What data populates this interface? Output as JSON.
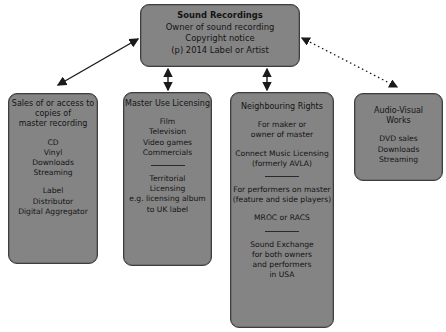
{
  "diagram": {
    "root": {
      "title": "Sound Recordings",
      "lines": [
        "Owner of sound recording",
        "Copyright notice",
        "(p) 2014 Label or Artist"
      ]
    },
    "nodes": [
      {
        "id": "sales",
        "title_lines": [
          "Sales of or access to",
          "copies of",
          "master recording"
        ],
        "group1": [
          "CD",
          "Vinyl",
          "Downloads",
          "Streaming"
        ],
        "group2": [
          "Label",
          "Distributor",
          "Digital Aggregator"
        ]
      },
      {
        "id": "master",
        "title": "Master Use Licensing",
        "group1": [
          "Film",
          "Television",
          "Video games",
          "Commercials"
        ],
        "group2": [
          "Territorial",
          "Licensing",
          "e.g. licensing album",
          "to UK label"
        ]
      },
      {
        "id": "neighbouring",
        "title": "Neighbouring Rights",
        "group1": [
          "For maker or",
          "owner of master"
        ],
        "group1b": [
          "Connect Music Licensing",
          "(formerly AVLA)"
        ],
        "group2": [
          "For performers on master",
          "(feature and side players)"
        ],
        "group2b": [
          "MROC or RACS"
        ],
        "group3": [
          "Sound Exchange",
          "for both owners",
          "and performers",
          "in USA"
        ]
      },
      {
        "id": "audiovisual",
        "title_lines": [
          "Audio-Visual",
          "Works"
        ],
        "group1": [
          "DVD sales",
          "Downloads",
          "Streaming"
        ]
      }
    ],
    "edges": [
      {
        "from": "root",
        "to": "sales",
        "style": "solid",
        "heads": "both"
      },
      {
        "from": "root",
        "to": "master",
        "style": "solid",
        "heads": "both"
      },
      {
        "from": "root",
        "to": "neighbouring",
        "style": "solid",
        "heads": "both"
      },
      {
        "from": "root",
        "to": "audiovisual",
        "style": "dotted",
        "heads": "both"
      }
    ],
    "colors": {
      "box_fill": "#848484",
      "box_border": "#3e3e3e",
      "text": "#141414",
      "arrow": "#1a1a1a"
    }
  }
}
